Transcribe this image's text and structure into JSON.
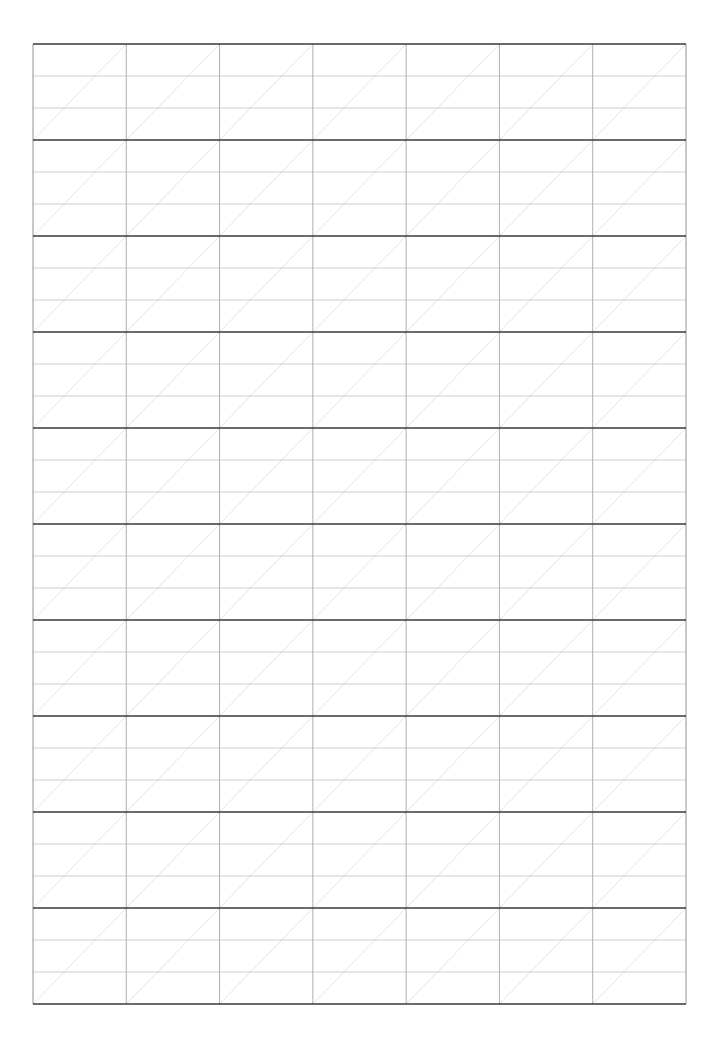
{
  "page": {
    "type": "handwriting-practice-grid",
    "width": 722,
    "height": 1043,
    "background": "#ffffff"
  },
  "grid": {
    "left": 33,
    "right": 686,
    "top": 44,
    "bottom": 1004,
    "columns": 7,
    "rows": 10,
    "guide_lines_per_row": 2,
    "diagonal_per_cell": true,
    "colors": {
      "row_border": "#3a3a3a",
      "column_line": "#9a9a9a",
      "guide_line": "#c4c4c4",
      "diagonal": "#d6d6d6",
      "outer_border": "#777777"
    },
    "widths": {
      "row_border": 1.6,
      "column_line": 0.8,
      "guide_line": 0.8,
      "diagonal": 0.7
    }
  }
}
